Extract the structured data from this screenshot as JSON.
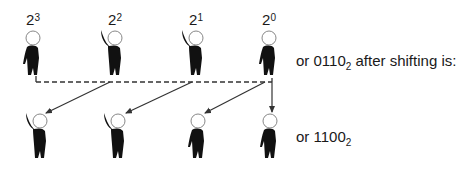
{
  "diagram": {
    "top_row": {
      "labels": [
        {
          "base": "2",
          "exp": "3"
        },
        {
          "base": "2",
          "exp": "2"
        },
        {
          "base": "2",
          "exp": "1"
        },
        {
          "base": "2",
          "exp": "0"
        }
      ],
      "people": [
        {
          "position": "2^3",
          "pose": "arm-down",
          "bit": 0
        },
        {
          "position": "2^2",
          "pose": "arm-up",
          "bit": 1
        },
        {
          "position": "2^1",
          "pose": "arm-up",
          "bit": 1
        },
        {
          "position": "2^0",
          "pose": "arm-down",
          "bit": 0
        }
      ],
      "caption": {
        "prefix": "or ",
        "value": "0110",
        "base_sub": "2",
        "suffix": " after shifting is:"
      }
    },
    "bottom_row": {
      "people": [
        {
          "position": "2^3",
          "pose": "arm-up",
          "bit": 1
        },
        {
          "position": "2^2",
          "pose": "arm-up",
          "bit": 1
        },
        {
          "position": "2^1",
          "pose": "arm-down",
          "bit": 0
        },
        {
          "position": "2^0",
          "pose": "arm-down",
          "bit": 0
        }
      ],
      "caption": {
        "prefix": "or ",
        "value": "1100",
        "base_sub": "2",
        "suffix": ""
      }
    },
    "connectors": {
      "style": "dashed bus line with arrows shifting each bit one place left; 2^0 receives a new 0",
      "colors": {
        "ink": "#1a1a1a",
        "line": "#333333"
      }
    }
  }
}
